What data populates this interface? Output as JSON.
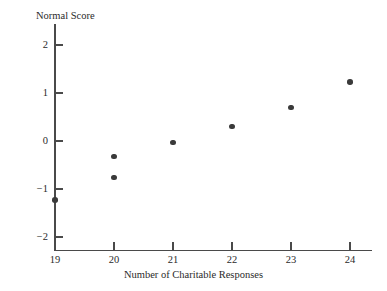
{
  "chart_data": {
    "type": "scatter",
    "title": "",
    "xlabel": "Number of Charitable Responses",
    "ylabel": "Normal Score",
    "xlim": [
      18.6,
      24.4
    ],
    "ylim": [
      -2.35,
      2.3
    ],
    "xticks": [
      19,
      20,
      21,
      22,
      23,
      24
    ],
    "xticklabels": [
      "19",
      "20",
      "21",
      "22",
      "23",
      "24"
    ],
    "yticks": [
      2,
      1,
      0,
      -1,
      -2
    ],
    "yticklabels": [
      "2",
      "1",
      "0",
      "−1",
      "−2"
    ],
    "grid": false,
    "legend": null,
    "marker": "filled-circle",
    "marker_color": "#3a3a3a",
    "axis_color": "#4a4a4a",
    "background": "#ffffff",
    "points": [
      {
        "x": 19,
        "y": -1.23
      },
      {
        "x": 20,
        "y": -0.76
      },
      {
        "x": 20,
        "y": -0.32
      },
      {
        "x": 21,
        "y": -0.03
      },
      {
        "x": 22,
        "y": 0.3
      },
      {
        "x": 23,
        "y": 0.7
      },
      {
        "x": 24,
        "y": 1.23
      }
    ],
    "x": [
      19,
      20,
      20,
      21,
      22,
      23,
      24
    ],
    "values": [
      -1.23,
      -0.76,
      -0.32,
      -0.03,
      0.3,
      0.7,
      1.23
    ]
  }
}
